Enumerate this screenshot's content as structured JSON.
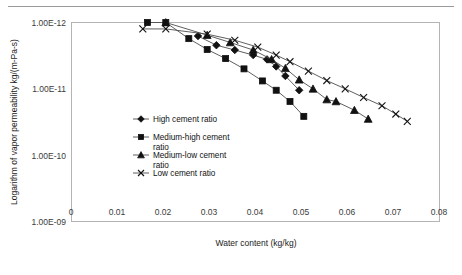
{
  "chart_data": {
    "type": "line",
    "title": "",
    "xlabel": "Water content (kg/kg)",
    "ylabel": "Logarithm of vapor permeability kg/(m-Pa-s)",
    "xlim": [
      0,
      0.08
    ],
    "ylim_log_top": "1.00E-12",
    "ylim_log_bottom": "1.00E-09",
    "grid": false,
    "legend_position": "inside-left-middle",
    "x_ticks": [
      "0",
      "0.01",
      "0.02",
      "0.03",
      "0.04",
      "0.05",
      "0.06",
      "0.07",
      "0.08"
    ],
    "x_tick_values": [
      0,
      0.01,
      0.02,
      0.03,
      0.04,
      0.05,
      0.06,
      0.07,
      0.08
    ],
    "y_ticks": [
      "1.00E-12",
      "1.00E-11",
      "1.00E-10",
      "1.00E-09"
    ],
    "y_tick_values": [
      1e-12,
      1e-11,
      1e-10,
      1e-09
    ],
    "y_axis_note": "Axis inverted: 1.00E-12 at top, 1.00E-09 at bottom",
    "series": [
      {
        "name": "High cement ratio",
        "marker": "diamond",
        "x": [
          0.0275,
          0.0315,
          0.0355,
          0.0395,
          0.0425,
          0.0445,
          0.0465,
          0.0495
        ],
        "y": [
          1.6e-12,
          2.2e-12,
          2.6e-12,
          3.1e-12,
          3.6e-12,
          4.6e-12,
          6.4e-12,
          1.05e-11
        ]
      },
      {
        "name": "Medium-high cement ratio",
        "marker": "square",
        "x": [
          0.0165,
          0.0205,
          0.0255,
          0.0295,
          0.0335,
          0.0375,
          0.0415,
          0.0445,
          0.0475,
          0.0505
        ],
        "y": [
          1e-12,
          1e-12,
          1.75e-12,
          2.55e-12,
          3.5e-12,
          5e-12,
          7.6e-12,
          1.05e-11,
          1.55e-11,
          2.6e-11
        ]
      },
      {
        "name": "Medium-low cement ratio",
        "marker": "triangle",
        "x": [
          0.0205,
          0.0295,
          0.0345,
          0.0395,
          0.0435,
          0.0465,
          0.0495,
          0.0525,
          0.0555,
          0.0575,
          0.0615,
          0.0645
        ],
        "y": [
          1e-12,
          1.55e-12,
          2e-12,
          2.6e-12,
          3.6e-12,
          4.9e-12,
          7.3e-12,
          1e-11,
          1.45e-11,
          1.55e-11,
          2.1e-11,
          2.85e-11
        ]
      },
      {
        "name": "Low cement ratio",
        "marker": "cross",
        "x": [
          0.0155,
          0.0205,
          0.0295,
          0.0355,
          0.0405,
          0.0445,
          0.0475,
          0.0515,
          0.0555,
          0.0595,
          0.0635,
          0.0675,
          0.0705,
          0.073
        ],
        "y": [
          1.25e-12,
          1.25e-12,
          1.5e-12,
          1.85e-12,
          2.35e-12,
          3.1e-12,
          3.9e-12,
          5.4e-12,
          7.5e-12,
          1e-11,
          1.35e-11,
          1.8e-11,
          2.4e-11,
          3.1e-11
        ]
      }
    ],
    "legend": [
      {
        "label": "High cement ratio",
        "marker": "diamond"
      },
      {
        "label": "Medium-high cement",
        "label2": "ratio",
        "marker": "square"
      },
      {
        "label": "Medium-low cement",
        "label2": "ratio",
        "marker": "triangle"
      },
      {
        "label": "Low cement ratio",
        "marker": "cross"
      }
    ],
    "colors": {
      "line": "#4d4d4d",
      "marker": "#111111",
      "frame": "#b4b4b4",
      "text": "#1a1a1a"
    }
  }
}
